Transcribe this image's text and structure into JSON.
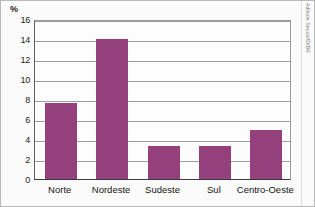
{
  "chart_data": {
    "type": "bar",
    "title": "",
    "subtitle": "",
    "xlabel": "",
    "ylabel": "%",
    "unit_label": "%",
    "categories": [
      "Norte",
      "Nordeste",
      "Sudeste",
      "Sul",
      "Centro-Oeste"
    ],
    "values": [
      7.6,
      14.0,
      3.3,
      3.35,
      4.9
    ],
    "series": [
      {
        "name": "",
        "values": [
          7.6,
          14.0,
          3.3,
          3.35,
          4.9
        ]
      }
    ],
    "ylim": [
      0,
      16
    ],
    "yticks": [
      0,
      2,
      4,
      6,
      8,
      10,
      12,
      14,
      16
    ],
    "ytick_labels": [
      "0",
      "2",
      "4",
      "6",
      "8",
      "10",
      "12",
      "14",
      "16"
    ],
    "grid": true,
    "grid_axis": "y",
    "legend": false,
    "legend_position": "none",
    "bar_color": "#93407c",
    "plot_background": "#fdfdfd",
    "gridline_color": "#9e9e9e",
    "axis_color": "#3b3b3b"
  },
  "credit": {
    "text": "Adilson Secco/ID/BR"
  }
}
